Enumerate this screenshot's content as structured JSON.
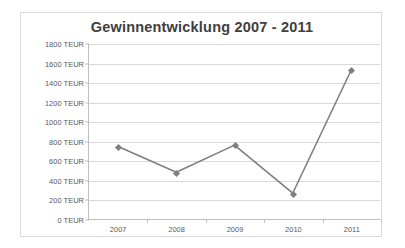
{
  "chart_data": {
    "type": "line",
    "title": "Gewinnentwicklung  2007 - 2011",
    "xlabel": "",
    "ylabel": "",
    "categories": [
      "2007",
      "2008",
      "2009",
      "2010",
      "2011"
    ],
    "values": [
      745,
      480,
      760,
      265,
      1525
    ],
    "series": [
      {
        "name": "Gewinn",
        "values": [
          745,
          480,
          760,
          265,
          1525
        ]
      }
    ],
    "ylim": [
      0,
      1800
    ],
    "ytick_step": 200,
    "ytick_labels": [
      "1800 TEUR",
      "1600 TEUR",
      "1400 TEUR",
      "1200 TEUR",
      "1000 TEUR",
      "800 TEUR",
      "600 TEUR",
      "400 TEUR",
      "200 TEUR",
      "0 TEUR"
    ],
    "ytick_values": [
      1800,
      1600,
      1400,
      1200,
      1000,
      800,
      600,
      400,
      200,
      0
    ],
    "unit": "TEUR",
    "grid": true,
    "legend": false,
    "legend_position": "none",
    "marker": "diamond",
    "colors": {
      "line": "#7f7f7f",
      "marker": "#7f7f7f",
      "gridline": "#d9d9d9",
      "axis": "#bfbfbf",
      "tick_text": "#595959",
      "title_text": "#404040",
      "border": "#d9d9d9",
      "background": "#ffffff"
    }
  }
}
